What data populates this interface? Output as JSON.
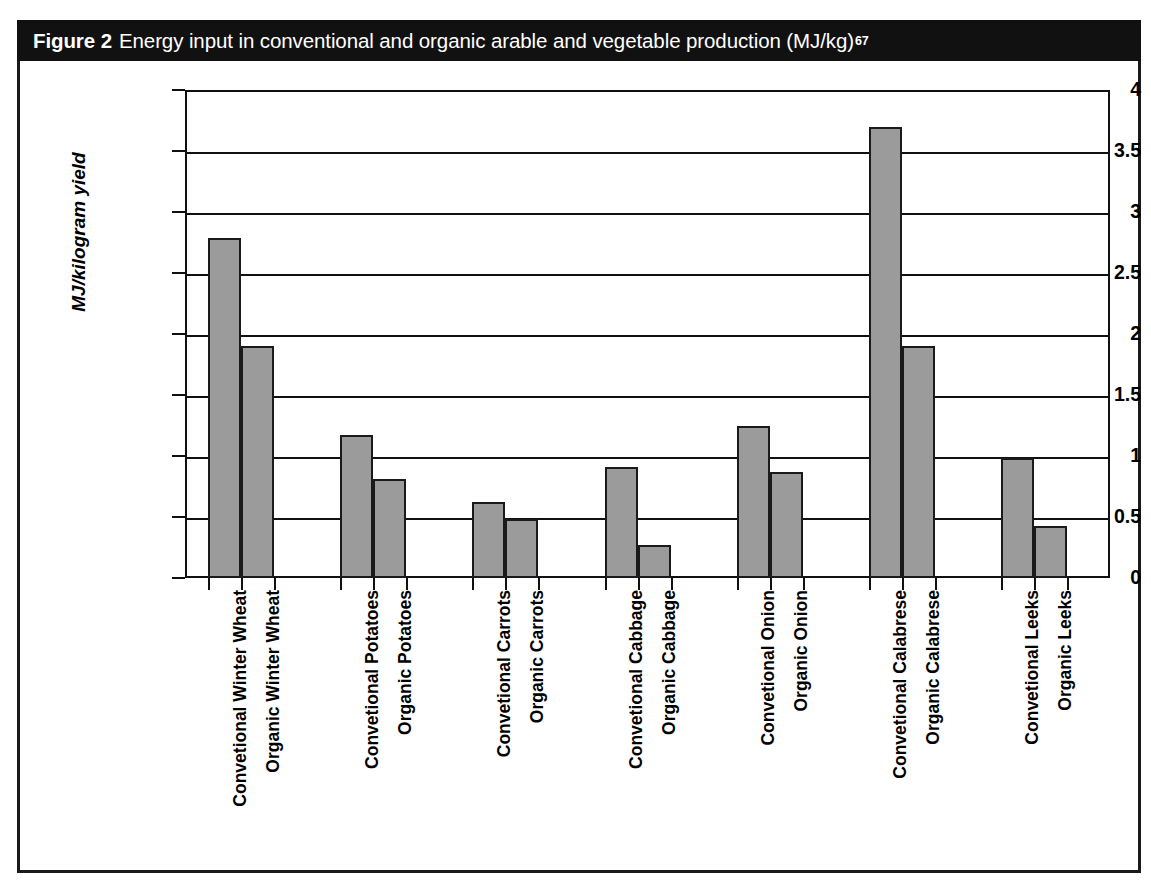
{
  "figure": {
    "label": "Figure 2",
    "caption": "Energy input in conventional and organic arable and vegetable production (MJ/kg)",
    "footnote_ref": "67"
  },
  "colors": {
    "banner_bg": "#111111",
    "banner_text": "#ffffff",
    "bar_fill": "#9b9b9b",
    "bar_border": "#1a1a1a",
    "axis": "#111111",
    "plot_bg": "#ffffff"
  },
  "chart_data": {
    "type": "bar",
    "title": "Energy input in conventional and organic arable and vegetable production (MJ/kg)",
    "xlabel": "",
    "ylabel": "MJ/kilogram yield",
    "ylim": [
      0,
      4
    ],
    "ytick_labels": [
      "4",
      "3.5",
      "3",
      "2.5",
      "2",
      "1.5",
      "1",
      "0.5",
      "0"
    ],
    "yticks": [
      4,
      3.5,
      3,
      2.5,
      2,
      1.5,
      1,
      0.5,
      0
    ],
    "grid": true,
    "legend": false,
    "categories": [
      "Convetional Winter Wheat",
      "Organic Winter Wheat",
      "Convetional Potatoes",
      "Organic Potatoes",
      "Convetional Carrots",
      "Organic Carrots",
      "Convetional Cabbage",
      "Organic Cabbage",
      "Convetional Onion",
      "Organic Onion",
      "Convetional Calabrese",
      "Organic Calabrese",
      "Convetional Leeks",
      "Organic Leeks"
    ],
    "values": [
      2.79,
      1.9,
      1.17,
      0.81,
      0.62,
      0.48,
      0.91,
      0.27,
      1.25,
      0.87,
      3.7,
      1.9,
      0.98,
      0.43
    ],
    "groups": [
      {
        "name": "Winter Wheat",
        "conventional": 2.79,
        "organic": 1.9
      },
      {
        "name": "Potatoes",
        "conventional": 1.17,
        "organic": 0.81
      },
      {
        "name": "Carrots",
        "conventional": 0.62,
        "organic": 0.48
      },
      {
        "name": "Cabbage",
        "conventional": 0.91,
        "organic": 0.27
      },
      {
        "name": "Onion",
        "conventional": 1.25,
        "organic": 0.87
      },
      {
        "name": "Calabrese",
        "conventional": 3.7,
        "organic": 1.9
      },
      {
        "name": "Leeks",
        "conventional": 0.98,
        "organic": 0.43
      }
    ]
  }
}
